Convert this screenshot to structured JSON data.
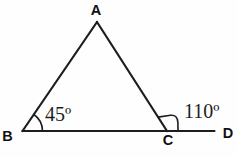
{
  "diagram": {
    "background_color": "#fefefe",
    "line_color": "#1d1d1d",
    "text_color": "#111111",
    "vertex_labels": {
      "a": "A",
      "b": "B",
      "c": "C",
      "d": "D"
    },
    "angle_labels": {
      "at_b": "45º",
      "at_c_exterior": "110º"
    }
  }
}
